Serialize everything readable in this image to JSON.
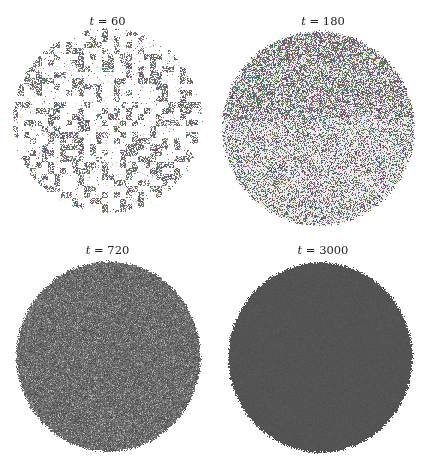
{
  "figure": {
    "background": "#ffffff",
    "panels": [
      {
        "id": "t60",
        "label_var": "t",
        "label_eq": " = ",
        "label_value": "60",
        "box": {
          "x": 0,
          "y": 0,
          "w": 215,
          "h": 234
        },
        "title_top": 14,
        "disk": {
          "cx": 107,
          "cy": 120,
          "rx": 94,
          "ry": 92
        },
        "pattern": "sparse-clusters",
        "fill_density": 0.42,
        "dark_color": "#4a4a4a",
        "light_color": "#d8d8d8",
        "seed": 60
      },
      {
        "id": "t180",
        "label_var": "t",
        "label_eq": " = ",
        "label_value": "180",
        "box": {
          "x": 215,
          "y": 0,
          "w": 216,
          "h": 234
        },
        "title_top": 14,
        "disk": {
          "cx": 318,
          "cy": 128,
          "rx": 96,
          "ry": 97
        },
        "pattern": "dense-speckle",
        "fill_density": 0.58,
        "dark_color": "#3e3e3e",
        "light_color": "#9a9a9a",
        "seed": 180
      },
      {
        "id": "t720",
        "label_var": "t",
        "label_eq": " = ",
        "label_value": "720",
        "box": {
          "x": 0,
          "y": 234,
          "w": 215,
          "h": 234
        },
        "title_top": 243,
        "disk": {
          "cx": 108,
          "cy": 356,
          "rx": 92,
          "ry": 95
        },
        "pattern": "fine-noise",
        "fill_density": 1.0,
        "dark_color": "#4c4c4c",
        "light_color": "#8e8e8e",
        "seed": 720
      },
      {
        "id": "t3000",
        "label_var": "t",
        "label_eq": " = ",
        "label_value": "3000",
        "box": {
          "x": 215,
          "y": 234,
          "w": 216,
          "h": 234
        },
        "title_top": 243,
        "disk": {
          "cx": 320,
          "cy": 357,
          "rx": 92,
          "ry": 95
        },
        "pattern": "near-uniform",
        "fill_density": 1.0,
        "dark_color": "#4f4f4f",
        "light_color": "#5e5e5e",
        "seed": 3000
      }
    ]
  }
}
